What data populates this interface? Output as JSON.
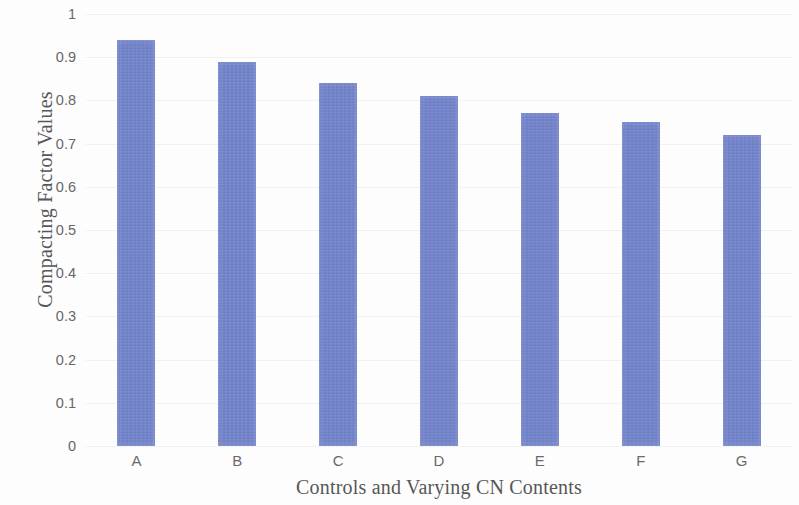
{
  "chart_data": {
    "type": "bar",
    "title": "",
    "subtitle": "",
    "xlabel": "Controls and Varying CN Contents",
    "ylabel": "Compacting Factor Values",
    "categories": [
      "A",
      "B",
      "C",
      "D",
      "E",
      "F",
      "G"
    ],
    "values": [
      0.94,
      0.89,
      0.84,
      0.81,
      0.77,
      0.75,
      0.72
    ],
    "series": [
      {
        "name": "Compacting Factor",
        "values": [
          0.94,
          0.89,
          0.84,
          0.81,
          0.77,
          0.75,
          0.72
        ]
      }
    ],
    "ylim": [
      0,
      1
    ],
    "xlim": null,
    "ytick_labels": [
      "1",
      "0.9",
      "0.8",
      "0.7",
      "0.6",
      "0.5",
      "0.4",
      "0.3",
      "0.2",
      "0.1",
      "0"
    ],
    "ytick_values": [
      1,
      0.9,
      0.8,
      0.7,
      0.6,
      0.5,
      0.4,
      0.3,
      0.2,
      0.1,
      0
    ],
    "ytick_step": 0.1,
    "xtick_labels": [
      "A",
      "B",
      "C",
      "D",
      "E",
      "F",
      "G"
    ],
    "grid": "faint-horizontal",
    "legend": null,
    "legend_position": "none",
    "annotations": [],
    "bar_color": "#7183cf",
    "background_color": "#fefefe",
    "text_color": "#575757"
  }
}
